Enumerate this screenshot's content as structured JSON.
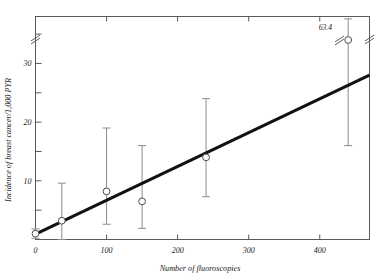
{
  "chart_data": {
    "type": "scatter",
    "title": "",
    "xlabel": "Number of fluoroscopies",
    "ylabel": "Incidence of breast cancer/1,000 PYR",
    "xlim": [
      0,
      470
    ],
    "ylim": [
      0,
      38
    ],
    "xticks": [
      0,
      100,
      200,
      300,
      400
    ],
    "xtick_labels": [
      "0",
      "100",
      "200",
      "300",
      "400"
    ],
    "yticks": [
      10,
      20,
      30
    ],
    "ytick_labels": [
      "10",
      "20",
      "30"
    ],
    "yminorticks": [
      5,
      15,
      25,
      35
    ],
    "grid": false,
    "legend": null,
    "y_axis_break": true,
    "y_axis_break_value": 37,
    "annotations": [
      {
        "text": "63.4",
        "x": 440,
        "y": 37.8,
        "note": "upper confidence limit of rightmost point, axis broken"
      }
    ],
    "points": [
      {
        "x": 0,
        "y": 1.0,
        "err_low": 0.2,
        "err_high": 1.8,
        "label": "0"
      },
      {
        "x": 37,
        "y": 3.2,
        "err_low": 0.0,
        "err_high": 9.6,
        "label": "37"
      },
      {
        "x": 100,
        "y": 8.2,
        "err_low": 2.6,
        "err_high": 19.0,
        "label": "100"
      },
      {
        "x": 150,
        "y": 6.5,
        "err_low": 1.9,
        "err_high": 16.0,
        "label": "150"
      },
      {
        "x": 240,
        "y": 14.0,
        "err_low": 7.3,
        "err_high": 24.0,
        "label": "240"
      },
      {
        "x": 440,
        "y": 34.0,
        "err_low": 16.0,
        "err_high": 63.4,
        "label": "440"
      }
    ],
    "fit_line": {
      "type": "linear",
      "x_start": 0,
      "y_start": 0.9,
      "x_end": 470,
      "y_end": 28.0
    },
    "series_name": "Breast cancer incidence vs fluoroscopy count",
    "marker_style": "open-circle",
    "errorbar_style": "capped-vertical"
  },
  "colors": {
    "fit_line": "#111111",
    "errorbar": "#8c8c8c",
    "marker_edge": "#4d4d4d",
    "marker_fill": "#ffffff",
    "axis": "#5a5a5a",
    "text": "#1a1a1a",
    "background": "#ffffff"
  }
}
